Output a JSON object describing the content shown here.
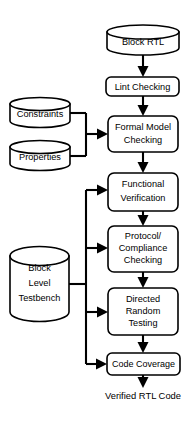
{
  "diagram": {
    "background_color": "#ffffff",
    "stroke_color": "#000000",
    "fill_color": "#ffffff",
    "nodes": {
      "block_rtl": {
        "label": "Block RTL",
        "shape": "cylinder"
      },
      "lint_checking": {
        "label": "Lint Checking",
        "shape": "rounded-rect"
      },
      "constraints": {
        "label": "Constraints",
        "shape": "cylinder"
      },
      "properties": {
        "label": "Properties",
        "shape": "cylinder"
      },
      "formal_model_checking": {
        "line1": "Formal Model",
        "line2": "Checking",
        "shape": "rounded-rect"
      },
      "functional_verification": {
        "line1": "Functional",
        "line2": "Verification",
        "shape": "rounded-rect"
      },
      "protocol_compliance_checking": {
        "line1": "Protocol/",
        "line2": "Compliance",
        "line3": "Checking",
        "shape": "rounded-rect"
      },
      "directed_random_testing": {
        "line1": "Directed",
        "line2": "Random",
        "line3": "Testing",
        "shape": "rounded-rect"
      },
      "block_level_testbench": {
        "line1": "Block",
        "line2": "Level",
        "line3": "Testbench",
        "shape": "cylinder"
      },
      "code_coverage": {
        "label": "Code Coverage",
        "shape": "rounded-rect"
      },
      "verified_rtl_code": {
        "label": "Verified RTL Code",
        "shape": "text"
      }
    },
    "edges": [
      {
        "from": "block_rtl",
        "to": "lint_checking",
        "type": "arrow-down"
      },
      {
        "from": "lint_checking",
        "to": "formal_model_checking",
        "type": "arrow-down"
      },
      {
        "from": "constraints",
        "to": "formal_model_checking",
        "type": "arrow-right"
      },
      {
        "from": "properties",
        "to": "formal_model_checking",
        "type": "arrow-right"
      },
      {
        "from": "formal_model_checking",
        "to": "functional_verification",
        "type": "arrow-down"
      },
      {
        "from": "functional_verification",
        "to": "protocol_compliance_checking",
        "type": "arrow-down"
      },
      {
        "from": "protocol_compliance_checking",
        "to": "directed_random_testing",
        "type": "arrow-down"
      },
      {
        "from": "directed_random_testing",
        "to": "code_coverage",
        "type": "arrow-down"
      },
      {
        "from": "code_coverage",
        "to": "verified_rtl_code",
        "type": "arrow-down"
      },
      {
        "from": "block_level_testbench",
        "to": "functional_verification",
        "type": "arrow-right"
      },
      {
        "from": "block_level_testbench",
        "to": "protocol_compliance_checking",
        "type": "arrow-right"
      },
      {
        "from": "block_level_testbench",
        "to": "directed_random_testing",
        "type": "arrow-right"
      },
      {
        "from": "block_level_testbench",
        "to": "code_coverage",
        "type": "arrow-right"
      }
    ]
  }
}
